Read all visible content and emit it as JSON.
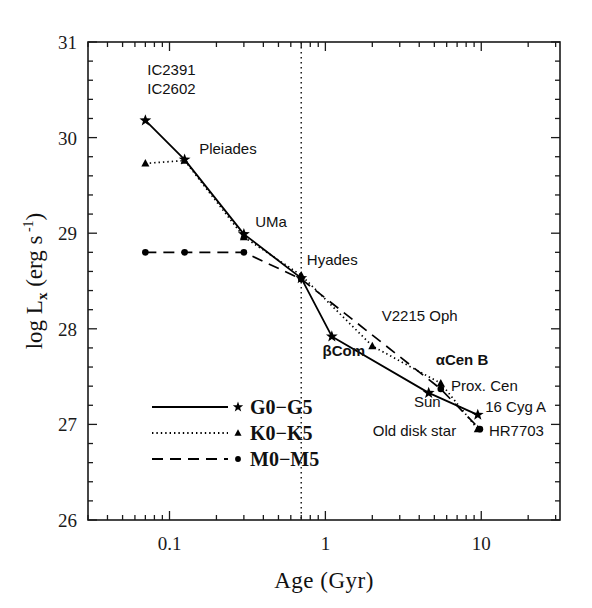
{
  "chart_data": {
    "type": "line",
    "title": "",
    "xlabel": "Age (Gyr)",
    "ylabel_parts": {
      "log": "log",
      "L": "L",
      "x": "x",
      "unit": "(erg s",
      "exp": "-1",
      "close": ")"
    },
    "ylabel": "log Lx (erg s-1)",
    "xscale": "log",
    "xlim": [
      0.03,
      32
    ],
    "ylim": [
      26,
      31
    ],
    "xticks_major": [
      0.1,
      1,
      10
    ],
    "xtick_labels": [
      "0.1",
      "1",
      "10"
    ],
    "yticks_major": [
      26,
      27,
      28,
      29,
      30,
      31
    ],
    "ytick_labels": [
      "26",
      "27",
      "28",
      "29",
      "30",
      "31"
    ],
    "grid": false,
    "legend_position": "lower-left-inside",
    "annotations": {
      "vertical_dotted_line_x": 0.7,
      "vertical_line_label": ""
    },
    "series": [
      {
        "name": "G0-G5",
        "linestyle": "solid",
        "marker": "star",
        "color": "#000000",
        "points": [
          {
            "x": 0.07,
            "y": 30.18,
            "label": "IC2391 IC2602"
          },
          {
            "x": 0.125,
            "y": 29.77,
            "label": "Pleiades"
          },
          {
            "x": 0.3,
            "y": 28.99,
            "label": "UMa"
          },
          {
            "x": 0.7,
            "y": 28.53,
            "label": "Hyades"
          },
          {
            "x": 1.1,
            "y": 27.92,
            "label": "βCom"
          },
          {
            "x": 4.6,
            "y": 27.33,
            "label": "Sun"
          },
          {
            "x": 9.5,
            "y": 27.1,
            "label": "16 Cyg A"
          }
        ]
      },
      {
        "name": "K0-K5",
        "linestyle": "dotted",
        "marker": "triangle",
        "color": "#000000",
        "points": [
          {
            "x": 0.07,
            "y": 29.73,
            "label": ""
          },
          {
            "x": 0.125,
            "y": 29.76,
            "label": ""
          },
          {
            "x": 0.3,
            "y": 28.96,
            "label": ""
          },
          {
            "x": 0.7,
            "y": 28.56,
            "label": ""
          },
          {
            "x": 2.0,
            "y": 27.82,
            "label": "V2215 Oph"
          },
          {
            "x": 5.5,
            "y": 27.43,
            "label": "αCen B"
          },
          {
            "x": 9.5,
            "y": 26.95,
            "label": "Old disk star"
          }
        ]
      },
      {
        "name": "M0-M5",
        "linestyle": "dashed",
        "marker": "circle",
        "color": "#000000",
        "points": [
          {
            "x": 0.07,
            "y": 28.8,
            "label": ""
          },
          {
            "x": 0.125,
            "y": 28.8,
            "label": ""
          },
          {
            "x": 0.3,
            "y": 28.8,
            "label": ""
          },
          {
            "x": 0.7,
            "y": 28.52,
            "label": ""
          },
          {
            "x": 5.5,
            "y": 27.37,
            "label": "Prox. Cen"
          },
          {
            "x": 9.8,
            "y": 26.95,
            "label": "HR7703"
          }
        ]
      }
    ],
    "point_labels": [
      {
        "text": "IC2391",
        "x": 0.072,
        "y": 30.66,
        "anchor": "start",
        "bold": false
      },
      {
        "text": "IC2602",
        "x": 0.072,
        "y": 30.46,
        "anchor": "start",
        "bold": false
      },
      {
        "text": "Pleiades",
        "x": 0.155,
        "y": 29.83,
        "anchor": "start",
        "bold": false
      },
      {
        "text": "UMa",
        "x": 0.355,
        "y": 29.07,
        "anchor": "start",
        "bold": false
      },
      {
        "text": "Hyades",
        "x": 0.76,
        "y": 28.67,
        "anchor": "start",
        "bold": false
      },
      {
        "text": "V2215 Oph",
        "x": 2.3,
        "y": 28.08,
        "anchor": "start",
        "bold": false
      },
      {
        "text": "βCom",
        "x": 0.96,
        "y": 27.72,
        "anchor": "start",
        "bold": true
      },
      {
        "text": "αCen B",
        "x": 5.1,
        "y": 27.62,
        "anchor": "start",
        "bold": true
      },
      {
        "text": "Prox. Cen",
        "x": 6.4,
        "y": 27.35,
        "anchor": "start",
        "bold": false
      },
      {
        "text": "Sun",
        "x": 3.7,
        "y": 27.18,
        "anchor": "start",
        "bold": false
      },
      {
        "text": "16 Cyg A",
        "x": 10.6,
        "y": 27.13,
        "anchor": "start",
        "bold": false
      },
      {
        "text": "Old disk star",
        "x": 6.9,
        "y": 26.88,
        "anchor": "end",
        "bold": false
      },
      {
        "text": "HR7703",
        "x": 11.2,
        "y": 26.88,
        "anchor": "start",
        "bold": false
      }
    ],
    "legend": [
      {
        "label": "G0−G5",
        "linestyle": "solid",
        "marker": "star"
      },
      {
        "label": "K0−K5",
        "linestyle": "dotted",
        "marker": "triangle"
      },
      {
        "label": "M0−M5",
        "linestyle": "dashed",
        "marker": "circle"
      }
    ]
  }
}
